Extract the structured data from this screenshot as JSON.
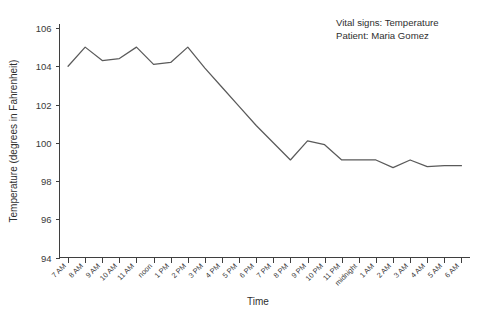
{
  "chart_data": {
    "type": "line",
    "title": "",
    "xlabel": "Time",
    "ylabel": "Temperature (degrees in Fahrenheit)",
    "ylim": [
      94,
      106
    ],
    "yticks": [
      94,
      96,
      98,
      100,
      102,
      104,
      106
    ],
    "grid": false,
    "legend_position": "none",
    "categories": [
      "7 AM",
      "8 AM",
      "9 AM",
      "10 AM",
      "11 AM",
      "noon",
      "1 PM",
      "2 PM",
      "3 PM",
      "4 PM",
      "5 PM",
      "6 PM",
      "7 PM",
      "8 PM",
      "9 PM",
      "10 PM",
      "11 PM",
      "midnight",
      "1 AM",
      "2 AM",
      "3 AM",
      "4 AM",
      "5 AM",
      "6 AM"
    ],
    "values": [
      104.0,
      105.0,
      104.3,
      104.4,
      105.0,
      104.1,
      104.2,
      105.0,
      103.9,
      102.9,
      101.9,
      100.9,
      100.0,
      99.1,
      100.1,
      99.9,
      99.1,
      99.1,
      99.1,
      98.7,
      99.1,
      98.75,
      98.8,
      98.8
    ],
    "series_color": "#5a5a5a",
    "annotations": [
      "Vital signs: Temperature",
      "Patient: Maria Gomez"
    ]
  }
}
